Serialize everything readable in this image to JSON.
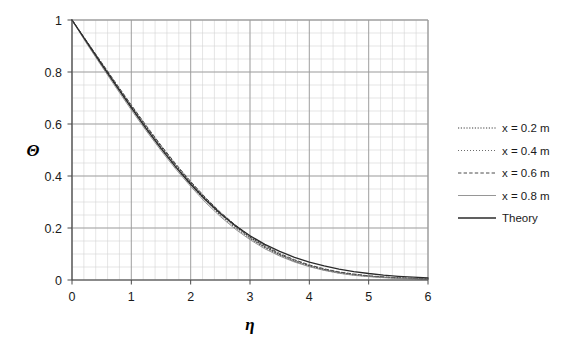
{
  "chart_data": {
    "type": "line",
    "title": "",
    "xlabel": "η",
    "ylabel": "Θ",
    "xlim": [
      0,
      6
    ],
    "ylim": [
      0,
      1
    ],
    "xticks": [
      "0",
      "1",
      "2",
      "3",
      "4",
      "5",
      "6"
    ],
    "yticks": [
      "0",
      "0.2",
      "0.4",
      "0.6",
      "0.8",
      "1"
    ],
    "xtick_values": [
      0,
      1,
      2,
      3,
      4,
      5,
      6
    ],
    "ytick_values": [
      0,
      0.2,
      0.4,
      0.6,
      0.8,
      1
    ],
    "grid": "major and minor gridlines on both axes",
    "minor_x_per_major": 5,
    "minor_y_per_major": 4,
    "legend_position": "right outside",
    "x": [
      0,
      0.25,
      0.5,
      0.75,
      1,
      1.25,
      1.5,
      1.75,
      2,
      2.25,
      2.5,
      2.75,
      3,
      3.25,
      3.5,
      3.75,
      4,
      4.25,
      4.5,
      4.75,
      5,
      5.25,
      5.5,
      5.75,
      6
    ],
    "series": [
      {
        "name": "x = 0.2 m",
        "style": "dotted",
        "color": "#3d3d3d",
        "values": [
          1.0,
          0.915,
          0.832,
          0.749,
          0.668,
          0.589,
          0.513,
          0.441,
          0.374,
          0.312,
          0.256,
          0.207,
          0.164,
          0.128,
          0.098,
          0.074,
          0.055,
          0.04,
          0.029,
          0.021,
          0.015,
          0.011,
          0.008,
          0.006,
          0.004
        ]
      },
      {
        "name": "x = 0.4 m",
        "style": "fine-dotted",
        "color": "#5a5a5a",
        "values": [
          1.0,
          0.912,
          0.827,
          0.743,
          0.661,
          0.581,
          0.505,
          0.433,
          0.366,
          0.304,
          0.249,
          0.201,
          0.159,
          0.124,
          0.095,
          0.071,
          0.053,
          0.038,
          0.027,
          0.019,
          0.014,
          0.01,
          0.007,
          0.005,
          0.003
        ]
      },
      {
        "name": "x = 0.6 m",
        "style": "dashed",
        "color": "#4a4a4a",
        "values": [
          1.0,
          0.918,
          0.836,
          0.754,
          0.673,
          0.594,
          0.518,
          0.446,
          0.379,
          0.317,
          0.261,
          0.212,
          0.169,
          0.133,
          0.102,
          0.078,
          0.058,
          0.043,
          0.031,
          0.023,
          0.016,
          0.012,
          0.008,
          0.006,
          0.004
        ]
      },
      {
        "name": "x = 0.8 m",
        "style": "solid-thin",
        "color": "#8a8a8a",
        "values": [
          1.0,
          0.908,
          0.822,
          0.737,
          0.654,
          0.574,
          0.498,
          0.426,
          0.36,
          0.298,
          0.244,
          0.196,
          0.155,
          0.12,
          0.092,
          0.069,
          0.051,
          0.037,
          0.026,
          0.018,
          0.013,
          0.009,
          0.006,
          0.004,
          0.003
        ]
      },
      {
        "name": "Theory",
        "style": "solid",
        "color": "#2b2b2b",
        "values": [
          1.0,
          0.9147,
          0.8296,
          0.7454,
          0.6627,
          0.5826,
          0.5062,
          0.4344,
          0.3683,
          0.3086,
          0.2556,
          0.2096,
          0.1703,
          0.1372,
          0.1098,
          0.0873,
          0.0689,
          0.0541,
          0.0421,
          0.0325,
          0.025,
          0.019,
          0.0143,
          0.0107,
          0.0079
        ]
      }
    ]
  },
  "legend": {
    "entries": [
      {
        "label": "x = 0.2 m"
      },
      {
        "label": "x = 0.4 m"
      },
      {
        "label": "x = 0.6 m"
      },
      {
        "label": "x = 0.8 m"
      },
      {
        "label": "Theory"
      }
    ]
  },
  "axes": {
    "y_title": "Θ",
    "x_title": "η"
  }
}
